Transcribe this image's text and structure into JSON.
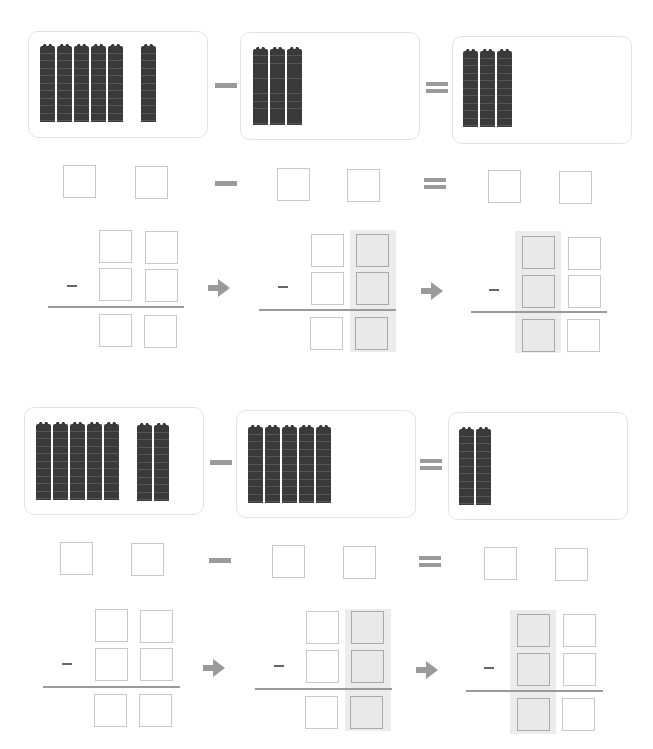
{
  "worksheet": {
    "type": "two-digit subtraction with base-ten blocks",
    "problems": [
      {
        "id": 1,
        "minuend_rods": 6,
        "minuend_groups": [
          5,
          1
        ],
        "subtrahend_rods": 3,
        "difference_rods": 3,
        "operators": {
          "minus": "−",
          "equals": "="
        }
      },
      {
        "id": 2,
        "minuend_rods": 7,
        "minuend_groups": [
          5,
          2
        ],
        "subtrahend_rods": 5,
        "difference_rods": 2,
        "operators": {
          "minus": "−",
          "equals": "="
        }
      }
    ],
    "vertical_minus_sign": "−",
    "colors": {
      "rod": "#3a3a3a",
      "operator": "#9a9a9a",
      "box_border": "#c9c9c9",
      "shaded_column": "#ececec",
      "card_border": "#e3e3e3"
    }
  }
}
